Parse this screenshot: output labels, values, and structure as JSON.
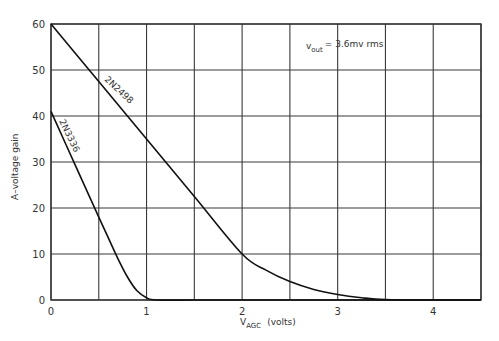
{
  "chart_data": {
    "type": "line",
    "title": "",
    "annotation": {
      "prefix": "v",
      "subscript": "out",
      "text": "= 3.6mv  rms"
    },
    "xlabel": {
      "main": "V",
      "subscript": "AGC",
      "unit": "(volts)"
    },
    "ylabel": "A–voltage  gain",
    "xlim": [
      0,
      4.5
    ],
    "ylim": [
      0,
      60
    ],
    "x_ticks": [
      0,
      1,
      2,
      3,
      4
    ],
    "x_tick_labels": [
      "0",
      "1",
      "2",
      "3",
      "4"
    ],
    "y_ticks": [
      0,
      10,
      20,
      30,
      40,
      50,
      60
    ],
    "y_tick_labels": [
      "0",
      "10",
      "20",
      "30",
      "40",
      "50",
      "60"
    ],
    "grid": true,
    "grid_x_step": 0.5,
    "grid_y_step": 10,
    "legend": "inline curve labels",
    "series": [
      {
        "name": "2N2498",
        "x": [
          0,
          0.5,
          1.0,
          1.5,
          2.0,
          2.25,
          2.5,
          2.75,
          3.0,
          3.25,
          3.5,
          4.0,
          4.5
        ],
        "y": [
          60,
          47.5,
          35,
          22.5,
          10,
          6.5,
          4,
          2.3,
          1.2,
          0.5,
          0.1,
          0,
          0
        ]
      },
      {
        "name": "2N3336",
        "x": [
          0,
          0.25,
          0.5,
          0.6,
          0.7,
          0.8,
          0.9,
          1.0,
          1.1,
          1.5,
          2.0,
          4.5
        ],
        "y": [
          41,
          29.5,
          18,
          13.5,
          9,
          5,
          2,
          0.5,
          0,
          0,
          0,
          0
        ]
      }
    ]
  }
}
